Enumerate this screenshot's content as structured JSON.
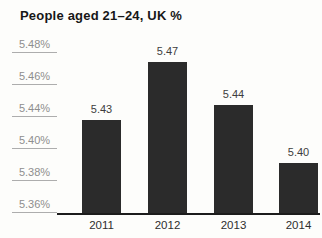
{
  "chart_data": {
    "type": "bar",
    "title": "People aged 21–24, UK %",
    "categories": [
      "2011",
      "2012",
      "2013",
      "2014"
    ],
    "values": [
      5.43,
      5.47,
      5.44,
      5.4
    ],
    "value_labels": [
      "5.43",
      "5.47",
      "5.44",
      "5.40"
    ],
    "y_tick_labels": [
      "5.48%",
      "5.46%",
      "5.44%",
      "5.40%",
      "5.38%",
      "5.36%"
    ],
    "y_axis_anomaly": "tick for 5.42% is missing although spacing is uniform",
    "xlabel": "",
    "ylabel": "",
    "grid": "off",
    "legend": "none",
    "data_labels": "on",
    "colors": {
      "bar": "#2b2b2b",
      "tick_text": "#8e8e8e",
      "tick_underline": "#adadad",
      "value_text": "#3d3d3d",
      "axis_line": "#1c1c1c",
      "title_text": "#171717"
    }
  }
}
